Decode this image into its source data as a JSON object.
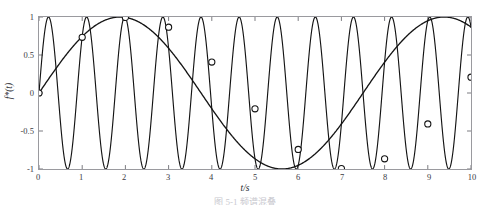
{
  "figure": {
    "top_clipped_text": "",
    "caption_clipped": "图 5-1  频谱混叠"
  },
  "axes": {
    "x_label": "t/s",
    "y_label": "f*(t)",
    "x_ticks": [
      "0",
      "1",
      "2",
      "3",
      "4",
      "5",
      "6",
      "7",
      "8",
      "9",
      "10"
    ],
    "y_ticks": [
      "1",
      "0.5",
      "0",
      "-0.5",
      "-1"
    ]
  },
  "chart_data": {
    "type": "line",
    "title": "",
    "xlabel": "t/s",
    "ylabel": "f*(t)",
    "xlim": [
      0,
      10
    ],
    "ylim": [
      -1,
      1
    ],
    "xticks": [
      0,
      1,
      2,
      3,
      4,
      5,
      6,
      7,
      8,
      9,
      10
    ],
    "yticks": [
      -1,
      -0.5,
      0,
      0.5,
      1
    ],
    "grid": false,
    "legend": "none",
    "series": [
      {
        "name": "original-signal",
        "description": "high-frequency sine, amplitude 1",
        "style": "solid-thin",
        "color": "#141414",
        "frequency_hz": 1.1333,
        "amplitude": 1.0,
        "phase": 0.0,
        "formula": "sin(2*pi*1.1333*t)"
      },
      {
        "name": "aliased-signal",
        "description": "reconstructed low-frequency alias through the sample points",
        "style": "solid-thin",
        "color": "#141414",
        "frequency_hz": 0.1333,
        "amplitude": 1.0,
        "phase": 0.0,
        "formula": "sin(2*pi*0.1333*t)"
      }
    ],
    "sample_markers": {
      "name": "sample-points",
      "marker": "open-circle",
      "x": [
        0,
        1,
        2,
        3,
        4,
        5,
        6,
        7,
        8,
        9,
        10
      ],
      "y": [
        0.0,
        0.7331,
        0.9945,
        0.866,
        0.4067,
        -0.2079,
        -0.7431,
        -0.9945,
        -0.866,
        -0.4067,
        0.2079
      ]
    }
  }
}
